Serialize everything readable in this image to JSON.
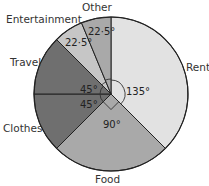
{
  "chart_data": {
    "type": "pie",
    "title": "",
    "start_angle_deg_clockwise_from_top": 0,
    "direction": "clockwise",
    "categories": [
      "Rent",
      "Food",
      "Clothes",
      "Travel",
      "Entertainment",
      "Other"
    ],
    "values": [
      135,
      90,
      45,
      45,
      22.5,
      22.5
    ],
    "unit": "degrees",
    "angle_labels": [
      "135°",
      "90°",
      "45°",
      "45°",
      "22·5°",
      "22·5°"
    ],
    "colors": [
      "#e2e2e2",
      "#a9a9a9",
      "#6f6f6f",
      "#6f6f6f",
      "#c6c6c6",
      "#a9a9a9"
    ],
    "legend": "none (labels placed outside slices)"
  },
  "labels": {
    "rent": "Rent",
    "food": "Food",
    "clothes": "Clothes",
    "travel": "Travel",
    "entertainment": "Entertainment",
    "other": "Other"
  },
  "angles": {
    "rent": "135°",
    "food": "90°",
    "clothes": "45°",
    "travel": "45°",
    "entertainment": "22·5°",
    "other": "22·5°"
  }
}
